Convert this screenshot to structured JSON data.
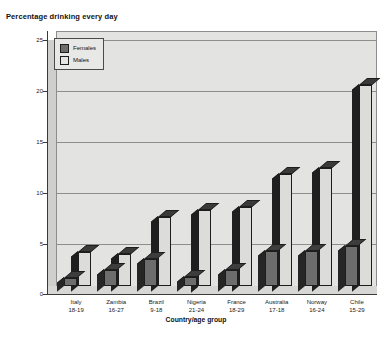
{
  "chart_data": {
    "type": "bar",
    "title": "Percentage drinking every day",
    "xlabel": "Country/age group",
    "ylabel": "",
    "ylim": [
      0,
      25
    ],
    "yticks": [
      0,
      5,
      10,
      15,
      20,
      25
    ],
    "grid": true,
    "legend_position": "top-left",
    "categories": [
      "Italy\n18-19",
      "Zambia\n16-27",
      "Brazil\n9-18",
      "Nigeria\n21-24",
      "France\n18-29",
      "Australia\n17-18",
      "Norway\n16-24",
      "Chile\n15-29"
    ],
    "category_names": [
      "Italy",
      "Zambia",
      "Brazil",
      "Nigeria",
      "France",
      "Australia",
      "Norway",
      "Chile"
    ],
    "category_ages": [
      "18-19",
      "16-27",
      "9-18",
      "21-24",
      "18-29",
      "17-18",
      "16-24",
      "15-29"
    ],
    "series": [
      {
        "name": "Females",
        "color": "#6d6d6d",
        "values": [
          0.8,
          1.6,
          2.6,
          0.9,
          1.6,
          3.4,
          3.4,
          3.9
        ]
      },
      {
        "name": "Males",
        "color": "#dcdcda",
        "values": [
          3.3,
          3.1,
          6.8,
          7.5,
          7.7,
          11.0,
          11.6,
          19.7
        ]
      }
    ]
  },
  "legend": {
    "items": [
      {
        "label": "Females"
      },
      {
        "label": "Males"
      }
    ]
  },
  "colors": {
    "plot_background": "#e3e3e1",
    "axis": "#3a3a3a",
    "gridline": "#8e8e8e",
    "females": "#6d6d6d",
    "males": "#dcdcda"
  }
}
